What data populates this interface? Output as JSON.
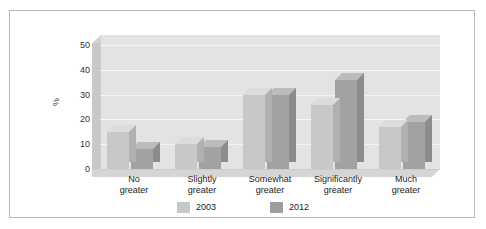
{
  "figure": {
    "frame_border_color": "#b9b9b9",
    "background": "#ffffff",
    "cut_caption_ghost": "· · ·"
  },
  "chart_data": {
    "type": "bar",
    "title": "",
    "subtitle": "",
    "xlabel": "",
    "ylabel": "%",
    "ylim": [
      0,
      50
    ],
    "yticks": [
      0,
      10,
      20,
      30,
      40,
      50
    ],
    "grid": true,
    "legend_position": "bottom",
    "three_d": true,
    "categories": [
      "No greater",
      "Slightly greater",
      "Somewhat greater",
      "Significantly greater",
      "Much greater"
    ],
    "category_lines": [
      [
        "No",
        "greater"
      ],
      [
        "Slightly",
        "greater"
      ],
      [
        "Somewhat",
        "greater"
      ],
      [
        "Significantly",
        "greater"
      ],
      [
        "Much",
        "greater"
      ]
    ],
    "series": [
      {
        "name": "2003",
        "color": "#c8c8c8",
        "values": [
          15,
          10,
          30,
          26,
          17
        ]
      },
      {
        "name": "2012",
        "color": "#9e9e9e",
        "values": [
          8,
          9,
          30,
          36,
          19
        ]
      }
    ]
  },
  "legend": {
    "items": [
      {
        "label": "2003",
        "color": "#c8c8c8"
      },
      {
        "label": "2012",
        "color": "#9e9e9e"
      }
    ]
  }
}
